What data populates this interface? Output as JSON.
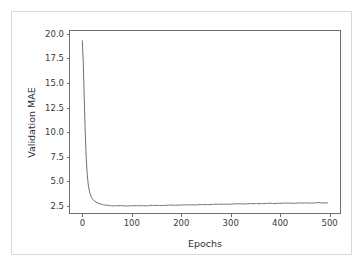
{
  "figure": {
    "top_cut_text": "· · · — ·· ——",
    "frame_color": "#d9d9dd",
    "background": "#ffffff"
  },
  "chart_data": {
    "type": "line",
    "title": "",
    "xlabel": "Epochs",
    "ylabel": "Validation MAE",
    "xlim": [
      -25,
      525
    ],
    "ylim": [
      1.55,
      20.3
    ],
    "grid": false,
    "legend": null,
    "line_color": "#6e6e6e",
    "line_width": 1,
    "xticks": [
      0,
      100,
      200,
      300,
      400,
      500
    ],
    "xtick_labels": [
      "0",
      "100",
      "200",
      "300",
      "400",
      "500"
    ],
    "yticks": [
      2.5,
      5.0,
      7.5,
      10.0,
      12.5,
      15.0,
      17.5,
      20.0
    ],
    "ytick_labels": [
      "2.5",
      "5.0",
      "7.5",
      "10.0",
      "12.5",
      "15.0",
      "17.5",
      "20.0"
    ],
    "series": [
      {
        "name": "Validation MAE",
        "x": [
          0,
          2,
          4,
          6,
          8,
          10,
          12,
          14,
          16,
          18,
          20,
          24,
          28,
          32,
          36,
          40,
          45,
          50,
          60,
          70,
          80,
          90,
          100,
          110,
          120,
          130,
          140,
          150,
          160,
          170,
          180,
          190,
          200,
          210,
          220,
          230,
          240,
          250,
          260,
          270,
          280,
          290,
          300,
          310,
          320,
          330,
          340,
          350,
          360,
          370,
          380,
          390,
          400,
          410,
          420,
          430,
          440,
          450,
          460,
          470,
          480,
          490,
          500
        ],
        "y": [
          19.3,
          17.1,
          13.4,
          9.9,
          7.3,
          5.6,
          4.55,
          3.92,
          3.52,
          3.24,
          3.05,
          2.82,
          2.68,
          2.58,
          2.5,
          2.44,
          2.38,
          2.35,
          2.3,
          2.29,
          2.3,
          2.28,
          2.3,
          2.29,
          2.31,
          2.3,
          2.33,
          2.32,
          2.34,
          2.33,
          2.36,
          2.35,
          2.38,
          2.37,
          2.4,
          2.39,
          2.41,
          2.4,
          2.43,
          2.45,
          2.44,
          2.47,
          2.46,
          2.48,
          2.5,
          2.49,
          2.51,
          2.5,
          2.53,
          2.52,
          2.54,
          2.53,
          2.56,
          2.55,
          2.57,
          2.56,
          2.58,
          2.57,
          2.59,
          2.58,
          2.6,
          2.59,
          2.6
        ]
      }
    ],
    "annotations": []
  }
}
